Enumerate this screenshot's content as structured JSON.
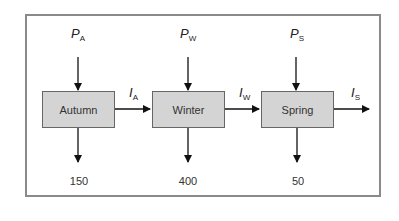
{
  "diagram": {
    "type": "seasonal flow diagram",
    "nodes": [
      {
        "id": "autumn",
        "label": "Autumn"
      },
      {
        "id": "winter",
        "label": "Winter"
      },
      {
        "id": "spring",
        "label": "Spring"
      }
    ],
    "inputs": [
      {
        "symbol": "P",
        "subscript": "A"
      },
      {
        "symbol": "P",
        "subscript": "W"
      },
      {
        "symbol": "P",
        "subscript": "S"
      }
    ],
    "transfers": [
      {
        "symbol": "I",
        "subscript": "A"
      },
      {
        "symbol": "I",
        "subscript": "W"
      },
      {
        "symbol": "I",
        "subscript": "S"
      }
    ],
    "outputs": [
      "150",
      "400",
      "50"
    ]
  }
}
